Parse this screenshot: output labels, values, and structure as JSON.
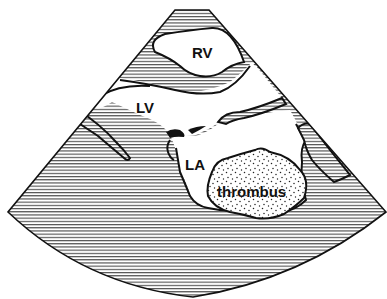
{
  "figure": {
    "type": "echocardiography schematic",
    "labels": {
      "rv": "RV",
      "lv": "LV",
      "la": "LA",
      "thrombus": "thrombus"
    },
    "colors": {
      "outline": "#111111",
      "hatch": "#333333",
      "background": "#ffffff",
      "stipple": "#222222"
    }
  }
}
